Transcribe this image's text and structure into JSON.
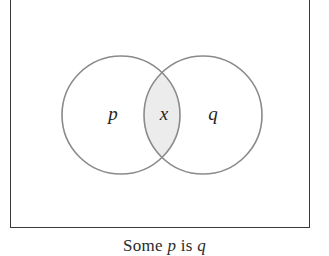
{
  "figure": {
    "type": "venn-diagram",
    "kind": "two-set-overlapping",
    "frame": {
      "border_color": "#3a3a3a",
      "background_color": "#ffffff"
    },
    "circles": [
      {
        "id": "left-circle",
        "label": "p",
        "cx": 121,
        "cy": 115,
        "r": 59,
        "stroke_color": "#8a8a8a",
        "fill_color": "#ffffff"
      },
      {
        "id": "right-circle",
        "label": "q",
        "cx": 203,
        "cy": 115,
        "r": 59,
        "stroke_color": "#8a8a8a",
        "fill_color": "#ffffff"
      }
    ],
    "intersection": {
      "id": "intersection-lens",
      "label": "x",
      "fill_color": "#ececec",
      "meaning": "shaded region marked x"
    },
    "labels": {
      "left": "p",
      "intersection": "x",
      "right": "q"
    }
  },
  "caption": {
    "prefix": "Some ",
    "subject": "p",
    "middle": " is ",
    "predicate": "q",
    "full_text": "Some p is q"
  }
}
